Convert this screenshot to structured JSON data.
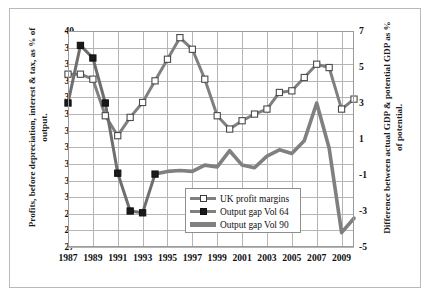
{
  "chart_data": {
    "type": "line",
    "title": "",
    "xlabel": "",
    "ylabel": "Profits, before depreciation, interest & tax, as % of output.",
    "y2label": "Difference between actual GDP & potential GDP as % of potential.",
    "grid": true,
    "legend_position": "inside-bottom-center",
    "x": [
      1987,
      1988,
      1989,
      1990,
      1991,
      1992,
      1993,
      1994,
      1995,
      1996,
      1997,
      1998,
      1999,
      2000,
      2001,
      2002,
      2003,
      2004,
      2005,
      2006,
      2007,
      2008,
      2009,
      2010
    ],
    "xlim": [
      1987,
      2010
    ],
    "xticks": [
      "1987",
      "1989",
      "1991",
      "1993",
      "1995",
      "1997",
      "1999",
      "2001",
      "2003",
      "2005",
      "2007",
      "2009"
    ],
    "xtick_values": [
      1987,
      1989,
      1991,
      1993,
      1995,
      1997,
      1999,
      2001,
      2003,
      2005,
      2007,
      2009
    ],
    "ylim": [
      27,
      40
    ],
    "yticks": [
      "27",
      "28",
      "29",
      "30",
      "31",
      "32",
      "33",
      "34",
      "35",
      "36",
      "37",
      "38",
      "39",
      "40"
    ],
    "ytick_values": [
      27,
      28,
      29,
      30,
      31,
      32,
      33,
      34,
      35,
      36,
      37,
      38,
      39,
      40
    ],
    "y2lim": [
      -5,
      7
    ],
    "y2ticks": [
      "-5",
      "-3",
      "-1",
      "1",
      "3",
      "5",
      "7"
    ],
    "y2tick_values": [
      -5,
      -3,
      -1,
      1,
      3,
      5,
      7
    ],
    "series": [
      {
        "name": "UK profit margins",
        "axis": "left",
        "color": "#808080",
        "marker": "open-square",
        "marker_fill": "#ffffff",
        "marker_edge": "#4a4a4a",
        "x": [
          1987,
          1988,
          1989,
          1990,
          1991,
          1992,
          1993,
          1994,
          1995,
          1996,
          1997,
          1998,
          1999,
          2000,
          2001,
          2002,
          2003,
          2004,
          2005,
          2006,
          2007,
          2008,
          2009,
          2010
        ],
        "values": [
          37.4,
          37.4,
          37.1,
          34.9,
          33.7,
          34.8,
          35.7,
          37.0,
          38.3,
          39.6,
          38.9,
          37.1,
          34.9,
          34.1,
          34.6,
          35.0,
          35.3,
          36.3,
          36.4,
          37.2,
          38.0,
          37.8,
          35.3,
          35.9
        ]
      },
      {
        "name": "Output gap Vol 64",
        "axis": "right",
        "color": "#6e6e6e",
        "marker": "filled-square",
        "marker_fill": "#1a1a1a",
        "marker_edge": "#111111",
        "x": [
          1987,
          1988,
          1989,
          1990,
          1991,
          1992,
          1993,
          1994
        ],
        "values": [
          3.0,
          6.2,
          5.5,
          3.0,
          -0.9,
          -3.0,
          -3.1,
          -0.95
        ]
      },
      {
        "name": "Output gap Vol 90",
        "axis": "right",
        "color": "#808080",
        "marker": "none",
        "x": [
          1994,
          1995,
          1996,
          1997,
          1998,
          1999,
          2000,
          2001,
          2002,
          2003,
          2004,
          2005,
          2006,
          2007,
          2008,
          2009,
          2010
        ],
        "values": [
          -0.95,
          -0.8,
          -0.75,
          -0.8,
          -0.45,
          -0.55,
          0.35,
          -0.45,
          -0.6,
          0.05,
          0.4,
          0.2,
          0.9,
          3.0,
          0.5,
          -4.2,
          -3.4
        ]
      }
    ]
  },
  "axes": {
    "left_title": "Profits, before depreciation, interest & tax, as % of output.",
    "right_title": "Difference between actual GDP & potential GDP as % of potential."
  },
  "legend": {
    "items": [
      {
        "label": "UK profit margins",
        "key": "line-open-square-key"
      },
      {
        "label": "Output gap Vol 64",
        "key": "line-filled-square-key"
      },
      {
        "label": "Output gap Vol 90",
        "key": "thick-line-key"
      }
    ]
  },
  "colors": {
    "series_gray": "#808080",
    "marker_dark": "#1a1a1a",
    "grid": "#b5b5b5",
    "frame": "#b9b9b9",
    "plot_border": "#9a9a9a",
    "text": "#111111",
    "background": "#ffffff"
  }
}
